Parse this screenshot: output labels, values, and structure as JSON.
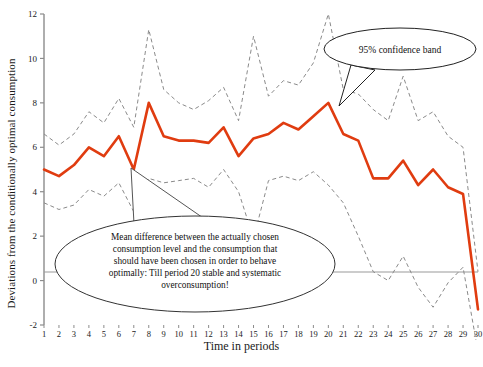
{
  "chart_data": {
    "type": "line",
    "title": "",
    "xlabel": "Time in periods",
    "ylabel": "Deviations from the conditionally optimal consumption",
    "xlim": [
      1,
      30
    ],
    "ylim": [
      -2,
      12
    ],
    "ytick_labels": [
      "-2",
      "0",
      "2",
      "4",
      "6",
      "8",
      "10",
      "12"
    ],
    "ytick_values": [
      -2,
      0,
      2,
      4,
      6,
      8,
      10,
      12
    ],
    "xtick_labels": [
      "1",
      "2",
      "3",
      "4",
      "5",
      "6",
      "7",
      "8",
      "9",
      "10",
      "11",
      "12",
      "13",
      "14",
      "15",
      "16",
      "17",
      "18",
      "19",
      "20",
      "21",
      "22",
      "23",
      "24",
      "25",
      "26",
      "27",
      "28",
      "29",
      "30"
    ],
    "x": [
      1,
      2,
      3,
      4,
      5,
      6,
      7,
      8,
      9,
      10,
      11,
      12,
      13,
      14,
      15,
      16,
      17,
      18,
      19,
      20,
      21,
      22,
      23,
      24,
      25,
      26,
      27,
      28,
      29,
      30
    ],
    "grid": false,
    "legend": "none",
    "zero_line": true,
    "series": [
      {
        "name": "Mean difference",
        "style": "solid",
        "color": "#E03C10",
        "width": 2.6,
        "values": [
          5.0,
          4.7,
          5.2,
          6.0,
          5.6,
          6.5,
          5.0,
          8.0,
          6.5,
          6.3,
          6.3,
          6.2,
          6.9,
          5.6,
          6.4,
          6.6,
          7.1,
          6.8,
          7.4,
          8.0,
          6.6,
          6.3,
          4.6,
          4.6,
          5.4,
          4.3,
          5.0,
          4.2,
          3.9,
          -1.3
        ]
      },
      {
        "name": "95% confidence band upper",
        "style": "dashed",
        "color": "#8a8a8a",
        "width": 1.0,
        "values": [
          6.6,
          6.1,
          6.6,
          7.6,
          7.1,
          8.2,
          6.9,
          11.3,
          8.6,
          8.0,
          7.7,
          8.1,
          8.7,
          7.2,
          11.0,
          8.3,
          9.0,
          8.8,
          9.8,
          12.0,
          8.6,
          8.4,
          7.7,
          7.2,
          9.2,
          7.2,
          7.6,
          6.5,
          6.0,
          0.4
        ]
      },
      {
        "name": "95% confidence band lower",
        "style": "dashed",
        "color": "#8a8a8a",
        "width": 1.0,
        "values": [
          3.5,
          3.2,
          3.4,
          4.1,
          3.8,
          4.4,
          3.1,
          4.6,
          4.4,
          4.5,
          4.6,
          4.2,
          5.0,
          4.0,
          1.9,
          4.5,
          4.7,
          4.5,
          4.9,
          4.3,
          3.5,
          2.0,
          0.4,
          0.0,
          1.1,
          -0.3,
          -1.2,
          -0.1,
          0.6,
          -3.2
        ]
      }
    ],
    "annotations": [
      {
        "id": "confidence-band-callout",
        "shape": "ellipse-callout",
        "text": "95% confidence band",
        "pointer_period": 20
      },
      {
        "id": "mean-difference-callout",
        "shape": "ellipse-callout",
        "lines": [
          "Mean difference between the actually chosen",
          "consumption level and the consumption that",
          "should have been chosen in order to behave",
          "optimally: Till period 20 stable and systematic",
          "overconsumption!"
        ],
        "pointer_period": 7
      }
    ]
  }
}
